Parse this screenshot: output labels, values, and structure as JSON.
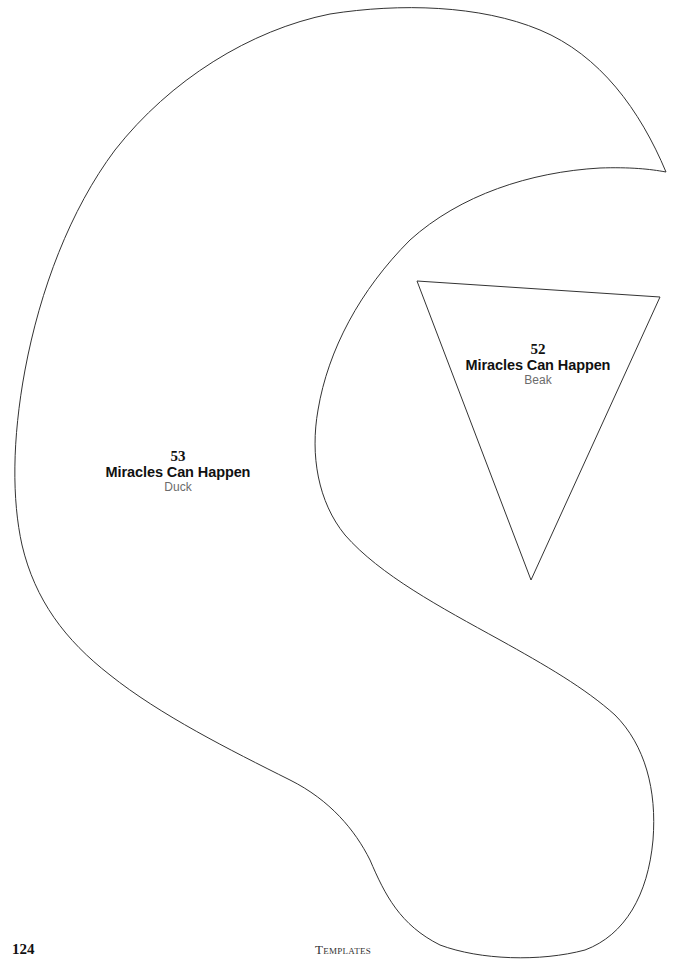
{
  "page": {
    "number": "124",
    "footer": "Templates",
    "background": "#ffffff",
    "line_color": "#333333"
  },
  "templates": [
    {
      "number": "53",
      "title": "Miracles Can Happen",
      "piece": "Duck",
      "shape": "duck-body-outline"
    },
    {
      "number": "52",
      "title": "Miracles Can Happen",
      "piece": "Beak",
      "shape": "triangle-outline"
    }
  ]
}
